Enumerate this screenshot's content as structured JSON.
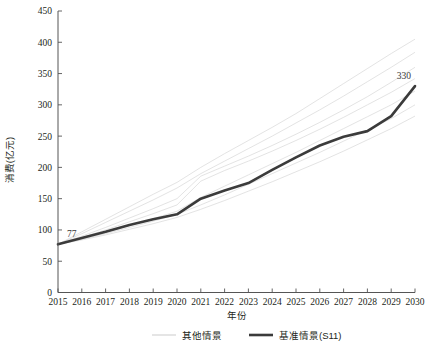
{
  "chart_data": {
    "type": "line",
    "title": "",
    "xlabel": "年份",
    "ylabel": "消费(亿元)",
    "xlim": [
      2015,
      2030
    ],
    "ylim": [
      0,
      450
    ],
    "ytick_step": 50,
    "grid": false,
    "legend_position": "bottom",
    "x": [
      2015,
      2016,
      2017,
      2018,
      2019,
      2020,
      2021,
      2022,
      2023,
      2024,
      2025,
      2026,
      2027,
      2028,
      2029,
      2030
    ],
    "xticklabels": [
      "2015",
      "2016",
      "2017",
      "2018",
      "2019",
      "2020",
      "2021",
      "2022",
      "2023",
      "2024",
      "2025",
      "2026",
      "2027",
      "2028",
      "2029",
      "2030"
    ],
    "yticklabels": [
      "0",
      "50",
      "100",
      "150",
      "200",
      "250",
      "300",
      "350",
      "400",
      "450"
    ],
    "yticks": [
      0,
      50,
      100,
      150,
      200,
      250,
      300,
      350,
      400,
      450
    ],
    "annotations": [
      {
        "text": "77",
        "x": 2015,
        "y": 77
      },
      {
        "text": "330",
        "x": 2030,
        "y": 330
      }
    ],
    "series": [
      {
        "name": "基准情景(S11)",
        "style": "bold-dark",
        "color": "#3b3b3b",
        "values": [
          77,
          87,
          97,
          108,
          117,
          125,
          150,
          163,
          175,
          196,
          216,
          235,
          249,
          258,
          282,
          330
        ]
      },
      {
        "name": "其他情景",
        "style": "faint",
        "color": "#cfcfcf",
        "values": [
          77,
          97,
          117,
          137,
          157,
          176,
          200,
          222,
          243,
          264,
          286,
          310,
          334,
          358,
          382,
          405
        ]
      },
      {
        "name": "其他情景",
        "style": "faint",
        "color": "#cfcfcf",
        "values": [
          77,
          94,
          112,
          130,
          148,
          167,
          190,
          210,
          230,
          250,
          271,
          292,
          314,
          337,
          360,
          384
        ]
      },
      {
        "name": "其他情景",
        "style": "faint",
        "color": "#cfcfcf",
        "values": [
          77,
          90,
          104,
          119,
          134,
          150,
          186,
          202,
          218,
          235,
          253,
          272,
          292,
          313,
          336,
          360
        ]
      },
      {
        "name": "其他情景",
        "style": "faint",
        "color": "#cfcfcf",
        "values": [
          77,
          88,
          100,
          113,
          126,
          140,
          178,
          195,
          210,
          226,
          243,
          261,
          280,
          300,
          320,
          342
        ]
      },
      {
        "name": "其他情景",
        "style": "faint",
        "color": "#cfcfcf",
        "values": [
          77,
          86,
          96,
          107,
          118,
          130,
          152,
          170,
          188,
          206,
          224,
          243,
          262,
          281,
          300,
          322
        ]
      },
      {
        "name": "其他情景",
        "style": "faint",
        "color": "#cfcfcf",
        "values": [
          77,
          85,
          94,
          104,
          114,
          125,
          140,
          156,
          173,
          190,
          207,
          224,
          242,
          260,
          278,
          300
        ]
      },
      {
        "name": "其他情景",
        "style": "faint",
        "color": "#cfcfcf",
        "values": [
          77,
          84,
          92,
          101,
          110,
          120,
          133,
          147,
          162,
          177,
          193,
          209,
          226,
          244,
          262,
          282
        ]
      }
    ]
  },
  "legend": {
    "items": [
      {
        "label": "其他情景",
        "style": "faint"
      },
      {
        "label": "基准情景(S11)",
        "style": "bold-dark"
      }
    ]
  }
}
